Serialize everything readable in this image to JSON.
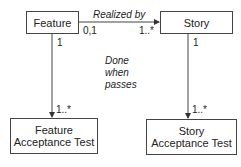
{
  "diagram": {
    "type": "uml-class-diagram",
    "nodes": {
      "feature": {
        "label": "Feature"
      },
      "story": {
        "label": "Story"
      },
      "feature_test": {
        "line1": "Feature",
        "line2": "Acceptance Test"
      },
      "story_test": {
        "line1": "Story",
        "line2": "Acceptance Test"
      }
    },
    "edges": {
      "realized_by": {
        "label": "Realized by",
        "source_mult": "0,1",
        "target_mult": "1..*"
      },
      "feature_to_test": {
        "source_mult": "1",
        "target_mult": "1..*"
      },
      "story_to_test": {
        "source_mult": "1",
        "target_mult": "1..*"
      }
    },
    "note": {
      "line1": "Done",
      "line2": "when",
      "line3": "passes"
    }
  }
}
